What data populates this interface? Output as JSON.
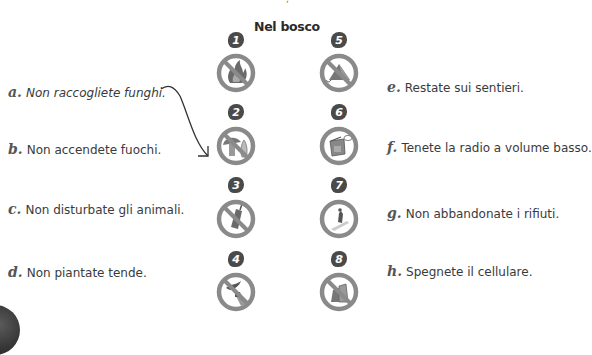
{
  "title": "Nel bosco",
  "example_arrow": {
    "from": "a",
    "to": 2
  },
  "icons": [
    {
      "number": "1",
      "name": "no-fire",
      "description": "fire crossed out"
    },
    {
      "number": "2",
      "name": "no-mushrooms",
      "description": "mushrooms crossed out"
    },
    {
      "number": "3",
      "name": "no-phone",
      "description": "mobile phone crossed out"
    },
    {
      "number": "4",
      "name": "no-animals",
      "description": "hand reaching toward bird crossed out"
    },
    {
      "number": "5",
      "name": "no-tent",
      "description": "tent crossed out"
    },
    {
      "number": "6",
      "name": "radio-low-volume",
      "description": "radio with speech bubble"
    },
    {
      "number": "7",
      "name": "stay-on-path",
      "description": "hiker on trail"
    },
    {
      "number": "8",
      "name": "no-litter",
      "description": "rubbish crossed out"
    }
  ],
  "labels": [
    {
      "letter": "a.",
      "text": "Non raccogliete funghi."
    },
    {
      "letter": "b.",
      "text": "Non accendete fuochi."
    },
    {
      "letter": "c.",
      "text": "Non disturbate gli animali."
    },
    {
      "letter": "d.",
      "text": "Non piantate tende."
    },
    {
      "letter": "e.",
      "text": "Restate sui sentieri."
    },
    {
      "letter": "f.",
      "text": "Tenete la radio a volume basso."
    },
    {
      "letter": "g.",
      "text": "Non abbandonate i rifiuti."
    },
    {
      "letter": "h.",
      "text": "Spegnete il cellulare."
    }
  ],
  "colors": {
    "ring": "#8a8a8a",
    "badge": "#4a4a4a",
    "text": "#3a3a3a"
  }
}
